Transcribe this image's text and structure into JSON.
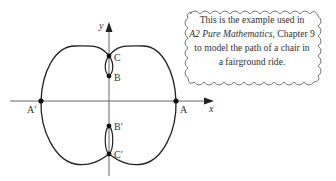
{
  "diagram": {
    "axes": {
      "x_label": "x",
      "y_label": "y"
    },
    "points": [
      {
        "name": "A",
        "label": "A"
      },
      {
        "name": "A-prime",
        "label": "A′"
      },
      {
        "name": "B",
        "label": "B"
      },
      {
        "name": "B-prime",
        "label": "B′"
      },
      {
        "name": "C",
        "label": "C"
      },
      {
        "name": "C-prime",
        "label": "C′"
      }
    ],
    "curve_color": "#222222",
    "axis_color": "#555555"
  },
  "callout": {
    "line1": "This is the example used in",
    "book_title": "A2 Pure Mathematics",
    "line2_rest": ", Chapter 9",
    "line3": "to model the path of a chair in",
    "line4": "a fairground ride."
  }
}
